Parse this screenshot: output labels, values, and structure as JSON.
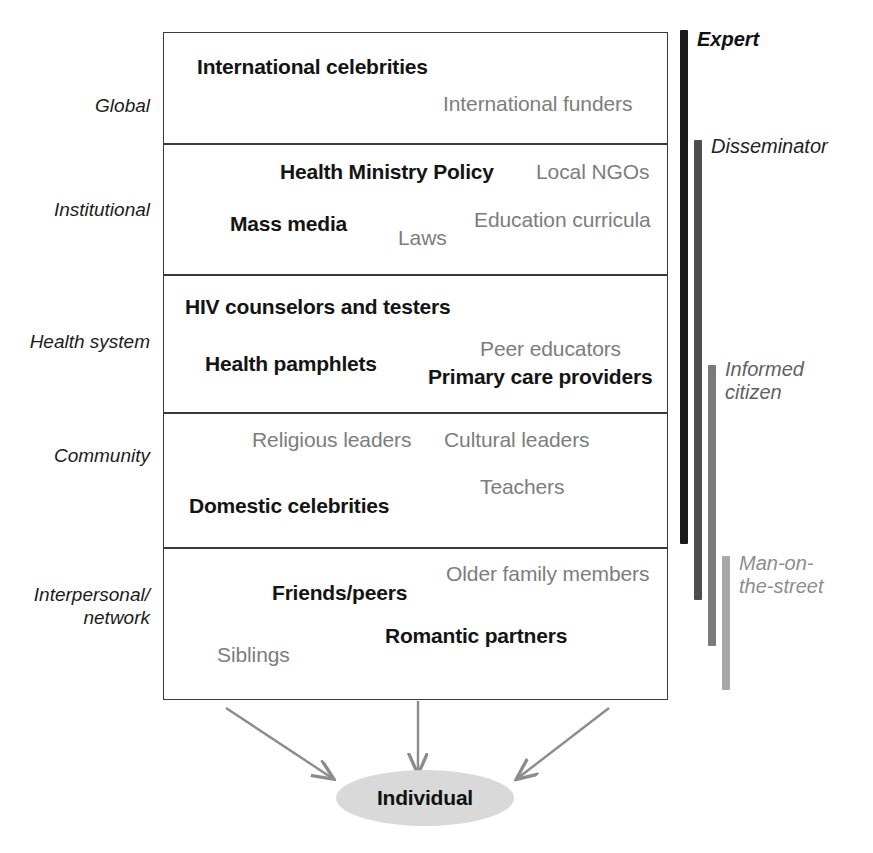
{
  "diagram": {
    "levels": [
      {
        "label": "Global",
        "items": [
          {
            "text": "International celebrities",
            "emphasis": "bold"
          },
          {
            "text": "International funders",
            "emphasis": "light"
          }
        ]
      },
      {
        "label": "Institutional",
        "items": [
          {
            "text": "Health Ministry Policy",
            "emphasis": "bold"
          },
          {
            "text": "Local NGOs",
            "emphasis": "light"
          },
          {
            "text": "Mass media",
            "emphasis": "bold"
          },
          {
            "text": "Laws",
            "emphasis": "light"
          },
          {
            "text": "Education curricula",
            "emphasis": "light"
          }
        ]
      },
      {
        "label": "Health system",
        "items": [
          {
            "text": "HIV counselors and testers",
            "emphasis": "bold"
          },
          {
            "text": "Peer educators",
            "emphasis": "light"
          },
          {
            "text": "Health pamphlets",
            "emphasis": "bold"
          },
          {
            "text": "Primary care providers",
            "emphasis": "bold"
          }
        ]
      },
      {
        "label": "Community",
        "items": [
          {
            "text": "Religious leaders",
            "emphasis": "light"
          },
          {
            "text": "Cultural leaders",
            "emphasis": "light"
          },
          {
            "text": "Teachers",
            "emphasis": "light"
          },
          {
            "text": "Domestic celebrities",
            "emphasis": "bold"
          }
        ]
      },
      {
        "label": "Interpersonal/\nnetwork",
        "items": [
          {
            "text": "Older family members",
            "emphasis": "light"
          },
          {
            "text": "Friends/peers",
            "emphasis": "bold"
          },
          {
            "text": "Romantic partners",
            "emphasis": "bold"
          },
          {
            "text": "Siblings",
            "emphasis": "light"
          }
        ]
      }
    ],
    "continuum": [
      {
        "label": "Expert",
        "color": "#1a1a1a",
        "weight": "bold"
      },
      {
        "label": "Disseminator",
        "color": "#4d4d4d",
        "weight": "normal"
      },
      {
        "label": "Informed\ncitizen",
        "color": "#7a7a7a",
        "weight": "normal"
      },
      {
        "label": "Man-on-\nthe-street",
        "color": "#a8a8a8",
        "weight": "normal"
      }
    ],
    "outcome": {
      "label": "Individual",
      "fill": "#d9d9d9"
    },
    "arrow_color": "#8c8c8c"
  }
}
